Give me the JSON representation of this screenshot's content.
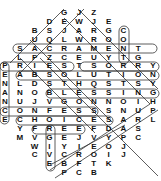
{
  "puzzle": {
    "type": "word-search",
    "shape": "diamond/hexagon",
    "rows": [
      {
        "start_col": 4,
        "letters": "GJZ"
      },
      {
        "start_col": 3,
        "letters": "DEWJE"
      },
      {
        "start_col": 2,
        "letters": "BSJARGC"
      },
      {
        "start_col": 2,
        "letters": "UQLWROO"
      },
      {
        "start_col": 1,
        "letters": "SACRAMENT"
      },
      {
        "start_col": 1,
        "letters": "LPZCEUYTG"
      },
      {
        "start_col": 0,
        "letters": "PRIESTSORRY"
      },
      {
        "start_col": 0,
        "letters": "EABSOLUTION"
      },
      {
        "start_col": 0,
        "letters": "NLDSTHQSTSY"
      },
      {
        "start_col": 0,
        "letters": "ANOBLESSING"
      },
      {
        "start_col": 0,
        "letters": "NUJVGONNOIH"
      },
      {
        "start_col": 0,
        "letters": "CONFESSSNUP"
      },
      {
        "start_col": 0,
        "letters": "ECHOICESARL"
      },
      {
        "start_col": 1,
        "letters": "YFREEFDAS"
      },
      {
        "start_col": 1,
        "letters": "MVGEJVYPC"
      },
      {
        "start_col": 2,
        "letters": "WIYIEOJ"
      },
      {
        "start_col": 2,
        "letters": "CVCROIJ"
      },
      {
        "start_col": 3,
        "letters": "EBFTK"
      },
      {
        "start_col": 4,
        "letters": "PCB"
      }
    ],
    "found_words": [
      {
        "word": "SACRAMENT",
        "from": [
          4,
          1
        ],
        "to": [
          4,
          9
        ]
      },
      {
        "word": "PRIEST",
        "from": [
          6,
          0
        ],
        "to": [
          6,
          5
        ]
      },
      {
        "word": "SORRY",
        "from": [
          6,
          6
        ],
        "to": [
          6,
          10
        ]
      },
      {
        "word": "ABSOLUTION",
        "from": [
          7,
          1
        ],
        "to": [
          7,
          10
        ]
      },
      {
        "word": "BLESSING",
        "from": [
          9,
          3
        ],
        "to": [
          9,
          10
        ]
      },
      {
        "word": "CONFESS",
        "from": [
          11,
          0
        ],
        "to": [
          11,
          6
        ]
      },
      {
        "word": "CHOICES",
        "from": [
          12,
          1
        ],
        "to": [
          12,
          7
        ]
      },
      {
        "word": "FREE",
        "from": [
          13,
          2
        ],
        "to": [
          13,
          5
        ]
      },
      {
        "word": "CONTG",
        "from": [
          2,
          8
        ],
        "to": [
          5,
          8
        ]
      },
      {
        "word": "PENANCE",
        "from": [
          6,
          0
        ],
        "to": [
          12,
          0
        ]
      },
      {
        "word": "GRIEVE",
        "from": [
          14,
          3
        ],
        "to": [
          17,
          3
        ]
      }
    ],
    "line_color": "#333333",
    "text_color": "#111111",
    "background": "#ffffff"
  }
}
